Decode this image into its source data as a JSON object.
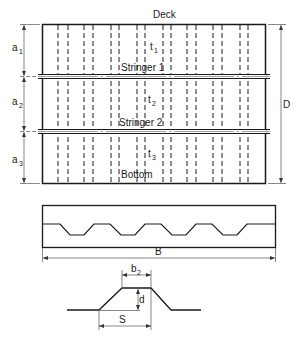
{
  "diagram": {
    "type": "ship-hull-plating-cross-section",
    "plan_view": {
      "top_label": "Deck",
      "bottom_label": "Bottom",
      "stringers": [
        {
          "label": "Stringer 1"
        },
        {
          "label": "Stringer 2"
        }
      ],
      "panel_thickness_labels": [
        {
          "base": "t",
          "sub": "1"
        },
        {
          "base": "t",
          "sub": "2"
        },
        {
          "base": "t",
          "sub": "3"
        }
      ],
      "spacing_labels": [
        {
          "base": "a",
          "sub": "1"
        },
        {
          "base": "a",
          "sub": "2"
        },
        {
          "base": "a",
          "sub": "3"
        }
      ],
      "depth_label": "D",
      "dashed_stiffener_count": 16
    },
    "section_view": {
      "width_label": "B",
      "corrugation_count": 5
    },
    "detail_view": {
      "flange_label": {
        "base": "b",
        "sub": "2"
      },
      "depth_label": "d",
      "pitch_label": "S"
    }
  },
  "colors": {
    "line": "#1a1a1a",
    "dim_line": "#555555",
    "background": "#ffffff"
  }
}
